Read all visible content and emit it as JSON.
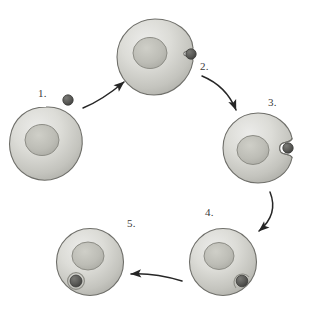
{
  "figure": {
    "background_color": "#ffffff",
    "width": 311,
    "height": 311
  },
  "palette": {
    "cell_fill_light": "#e2e2de",
    "cell_fill_mid": "#c8c8c2",
    "cell_fill_dark": "#a9a9a3",
    "cell_outline": "#6f6f6a",
    "nucleus_fill": "#b9b9b2",
    "nucleus_outline": "#8d8d86",
    "particle_fill": "#5a5a58",
    "particle_outline": "#3c3c3a",
    "vesicle_ring": "#9a9a94",
    "arrow_color": "#262626",
    "label_color": "#3a3a3a"
  },
  "steps": [
    {
      "id": "step-1",
      "label": "1.",
      "description": "Resting cell with free particle outside",
      "cell_shape": "irregular-blob",
      "particle_state": "free-extracellular",
      "cell_center": {
        "x": 46,
        "y": 143
      },
      "cell_radius": 36,
      "nucleus_center": {
        "x": 42,
        "y": 140
      },
      "nucleus_radius": 16,
      "particle": {
        "x": 68,
        "y": 100,
        "r": 5
      }
    },
    {
      "id": "step-2",
      "label": "2.",
      "description": "Particle binds to cell surface receptors; slight membrane dimple",
      "cell_shape": "round-with-shallow-notch",
      "particle_state": "bound-at-surface",
      "cell_center": {
        "x": 155,
        "y": 57
      },
      "cell_radius": 38,
      "nucleus_center": {
        "x": 150,
        "y": 52
      },
      "nucleus_radius": 16,
      "particle": {
        "x": 190,
        "y": 53,
        "r": 5
      }
    },
    {
      "id": "step-3",
      "label": "3.",
      "description": "Membrane invaginates, engulfing the particle",
      "cell_shape": "round-with-deep-invagination",
      "particle_state": "engulfed-in-pocket",
      "cell_center": {
        "x": 258,
        "y": 148
      },
      "cell_radius": 35,
      "nucleus_center": {
        "x": 253,
        "y": 150
      },
      "nucleus_radius": 15,
      "particle": {
        "x": 288,
        "y": 148,
        "r": 5
      }
    },
    {
      "id": "step-4",
      "label": "4.",
      "description": "Vesicle pinches off at the membrane",
      "cell_shape": "round-closed",
      "particle_state": "vesicle-at-membrane",
      "cell_center": {
        "x": 223,
        "y": 262
      },
      "cell_radius": 33,
      "nucleus_center": {
        "x": 219,
        "y": 256
      },
      "nucleus_radius": 14,
      "particle": {
        "x": 242,
        "y": 280,
        "r": 5.5
      }
    },
    {
      "id": "step-5",
      "label": "5.",
      "description": "Vesicle fully internalized within the cytoplasm",
      "cell_shape": "round-closed",
      "particle_state": "internalized-vesicle",
      "cell_center": {
        "x": 90,
        "y": 262
      },
      "cell_radius": 33,
      "nucleus_center": {
        "x": 88,
        "y": 256
      },
      "nucleus_radius": 14,
      "particle": {
        "x": 76,
        "y": 281,
        "r": 6
      }
    }
  ],
  "arrows": [
    {
      "id": "arrow-1-2",
      "from": "step-1",
      "to": "step-2",
      "direction": "up-right",
      "curve": "slight"
    },
    {
      "id": "arrow-2-3",
      "from": "step-2",
      "to": "step-3",
      "direction": "down-right",
      "curve": "strong"
    },
    {
      "id": "arrow-3-4",
      "from": "step-3",
      "to": "step-4",
      "direction": "down-left",
      "curve": "strong"
    },
    {
      "id": "arrow-4-5",
      "from": "step-4",
      "to": "step-5",
      "direction": "left",
      "curve": "slight"
    }
  ]
}
